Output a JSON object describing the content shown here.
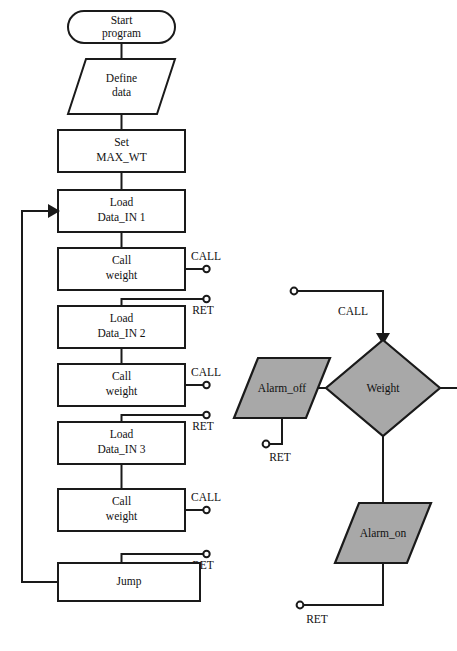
{
  "diagram": {
    "colors": {
      "fill_gray": "#a8a8a8",
      "fill_white": "#ffffff",
      "stroke": "#1a1a1a"
    },
    "main_program": {
      "nodes": [
        {
          "id": "start",
          "shape": "terminator",
          "label_line1": "Start",
          "label_line2": "program"
        },
        {
          "id": "define",
          "shape": "parallelogram",
          "label_line1": "Define",
          "label_line2": "data"
        },
        {
          "id": "set",
          "shape": "process",
          "label_line1": "Set",
          "label_line2": "MAX_WT"
        },
        {
          "id": "load1",
          "shape": "process",
          "label_line1": "Load",
          "label_line2": "Data_IN 1"
        },
        {
          "id": "call1",
          "shape": "process",
          "label_line1": "Call",
          "label_line2": "weight"
        },
        {
          "id": "load2",
          "shape": "process",
          "label_line1": "Load",
          "label_line2": "Data_IN 2"
        },
        {
          "id": "call2",
          "shape": "process",
          "label_line1": "Call",
          "label_line2": "weight"
        },
        {
          "id": "load3",
          "shape": "process",
          "label_line1": "Load",
          "label_line2": "Data_IN 3"
        },
        {
          "id": "call3",
          "shape": "process",
          "label_line1": "Call",
          "label_line2": "weight"
        },
        {
          "id": "jump",
          "shape": "process",
          "label_line1": "Jump",
          "label_line2": ""
        }
      ],
      "connector_tags": [
        {
          "id": "call-tag-1",
          "label": "CALL"
        },
        {
          "id": "ret-tag-1",
          "label": "RET"
        },
        {
          "id": "call-tag-2",
          "label": "CALL"
        },
        {
          "id": "ret-tag-2",
          "label": "RET"
        },
        {
          "id": "call-tag-3",
          "label": "CALL"
        },
        {
          "id": "ret-tag-3",
          "label": "RET"
        }
      ],
      "loop": {
        "from": "jump",
        "to": "load1"
      }
    },
    "subroutine": {
      "nodes": [
        {
          "id": "weight",
          "shape": "decision",
          "label": "Weight"
        },
        {
          "id": "alarm_off",
          "shape": "parallelogram",
          "label": "Alarm_off"
        },
        {
          "id": "alarm_on",
          "shape": "parallelogram",
          "label": "Alarm_on"
        }
      ],
      "connector_tags": [
        {
          "id": "sub-call-tag",
          "label": "CALL"
        },
        {
          "id": "sub-ret-tag-off",
          "label": "RET"
        },
        {
          "id": "sub-ret-tag-on",
          "label": "RET"
        }
      ]
    }
  }
}
